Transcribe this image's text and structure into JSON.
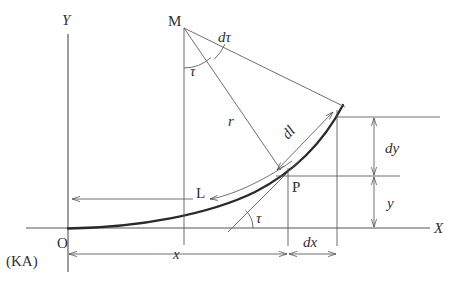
{
  "figure": {
    "kind": "geometry-diagram",
    "stroke_color": "#555558",
    "curve_color": "#2a2a2c",
    "text_color": "#303033"
  },
  "axes": {
    "x_label": "X",
    "y_label": "Y",
    "origin_label": "O",
    "origin_alt_label": "(KA)"
  },
  "points": {
    "center_label": "M",
    "point_label": "P"
  },
  "labels": {
    "tau_top": "τ",
    "tau_bottom": "τ",
    "d_tau": "dτ",
    "radius": "r",
    "arc_element": "dl",
    "arc_length": "L",
    "dx": "dx",
    "dy": "dy",
    "x": "x",
    "y": "y"
  },
  "geometry": {
    "origin": [
      68,
      228
    ],
    "m_point": [
      184,
      28
    ],
    "p_point": [
      288,
      176
    ],
    "curve_end": [
      343,
      105
    ],
    "dl_start": [
      277,
      168
    ],
    "dl_end": [
      331,
      113
    ],
    "x_dim_y": 254,
    "dy_dim_x": 374,
    "tangent_angle_deg": 52
  }
}
